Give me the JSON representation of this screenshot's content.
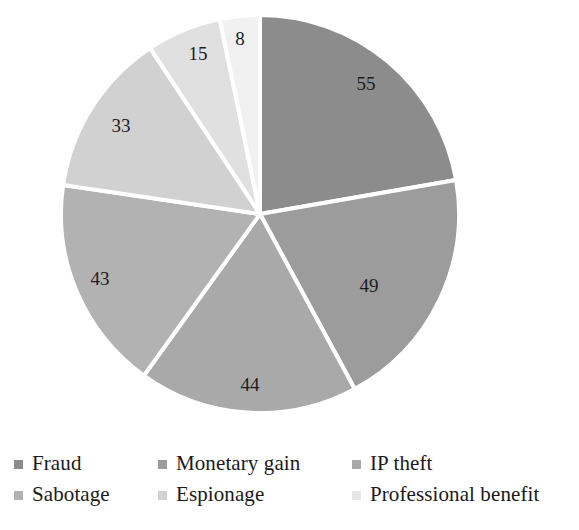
{
  "chart_data": {
    "type": "pie",
    "title": "",
    "subtitle": "",
    "xlabel": "",
    "ylabel": "",
    "grid": false,
    "legend_position": "bottom",
    "legend_columns": 3,
    "legend_rows": 2,
    "start_angle_deg": 0,
    "direction": "clockwise",
    "total": 247,
    "categories": [
      "Fraud",
      "Monetary gain",
      "IP theft",
      "Sabotage",
      "Espionage",
      "Professional benefit"
    ],
    "values": [
      55,
      49,
      44,
      43,
      33,
      15
    ],
    "slices": [
      {
        "label": "Fraud",
        "value": 55,
        "value_text": "55",
        "color": "#8c8c8c",
        "label_x": 366,
        "label_y": 86
      },
      {
        "label": "Monetary gain",
        "value": 49,
        "value_text": "49",
        "color": "#9c9c9c",
        "label_x": 369,
        "label_y": 288
      },
      {
        "label": "IP theft",
        "value": 44,
        "value_text": "44",
        "color": "#a9a9a9",
        "label_x": 250,
        "label_y": 387
      },
      {
        "label": "Sabotage",
        "value": 43,
        "value_text": "43",
        "color": "#b2b2b2",
        "label_x": 100,
        "label_y": 281
      },
      {
        "label": "Espionage",
        "value": 33,
        "value_text": "33",
        "color": "#d1d1d1",
        "label_x": 121,
        "label_y": 128
      },
      {
        "label": "Professional benefit",
        "value": 15,
        "value_text": "15",
        "color": "#e0e0e0",
        "label_x": 198,
        "label_y": 56
      },
      {
        "label": "",
        "value": 8,
        "value_text": "8",
        "color": "#f1f1f1",
        "label_x": 240,
        "label_y": 41
      }
    ],
    "geometry": {
      "center_x": 260,
      "center_y": 214,
      "radius": 199,
      "separator_color": "#ffffff",
      "separator_width": 4
    },
    "background_color": "#ffffff",
    "label_text_color": "#1d1d1d"
  },
  "legend": {
    "rows": [
      [
        {
          "label": "Fraud",
          "color": "#8c8c8c"
        },
        {
          "label": "Monetary gain",
          "color": "#9c9c9c"
        },
        {
          "label": "IP theft",
          "color": "#a9a9a9"
        }
      ],
      [
        {
          "label": "Sabotage",
          "color": "#b2b2b2"
        },
        {
          "label": "Espionage",
          "color": "#d1d1d1"
        },
        {
          "label": "Professional benefit",
          "color": "#e6e6e6"
        }
      ]
    ]
  }
}
